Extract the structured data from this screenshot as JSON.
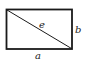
{
  "diagram": {
    "shape": "rectangle-with-diagonal",
    "labels": {
      "diagonal": "e",
      "height": "b",
      "width": "a"
    },
    "colors": {
      "stroke": "#1a1a1a",
      "text": "#222222",
      "background": "#ffffff"
    }
  }
}
